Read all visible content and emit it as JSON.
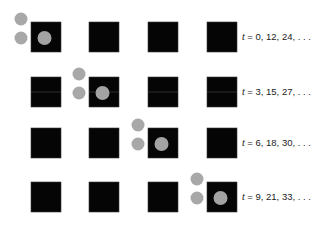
{
  "diagram": {
    "title": "",
    "grid_rows": 4,
    "grid_cols": 4,
    "rows": [
      {
        "highlight_col": 0,
        "label_var": "t",
        "label_values": " = 0, 12, 24, . . .",
        "has_midline": false
      },
      {
        "highlight_col": 1,
        "label_var": "t",
        "label_values": " = 3, 15, 27, . . .",
        "has_midline": true
      },
      {
        "highlight_col": 2,
        "label_var": "t",
        "label_values": " = 6, 18, 30, . . .",
        "has_midline": false
      },
      {
        "highlight_col": 3,
        "label_var": "t",
        "label_values": " = 9, 21, 33, . . .",
        "has_midline": false
      }
    ],
    "colors": {
      "square": "#050505",
      "dot": "#a8a8a8",
      "background": "#ffffff"
    }
  }
}
